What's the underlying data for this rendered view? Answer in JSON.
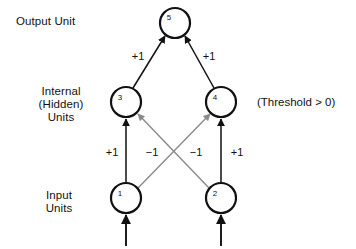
{
  "figure": {
    "type": "neural-network-diagram",
    "background_color": "#ffffff",
    "edge_color_excitatory": "#111111",
    "edge_color_inhibitory": "#8a8a8a"
  },
  "labels": {
    "output_layer": "Output Unit",
    "hidden_layer_line1": "Internal",
    "hidden_layer_line2": "(Hidden)",
    "hidden_layer_line3": "Units",
    "input_layer_line1": "Input",
    "input_layer_line2": "Units",
    "threshold_note": "(Threshold > 0)"
  },
  "nodes": [
    {
      "id": "5",
      "label": "5",
      "layer": "output",
      "cx": 175,
      "cy": 23,
      "r": 15
    },
    {
      "id": "3",
      "label": "3",
      "layer": "hidden",
      "cx": 126,
      "cy": 102,
      "r": 15
    },
    {
      "id": "4",
      "label": "4",
      "layer": "hidden",
      "cx": 221,
      "cy": 102,
      "r": 15
    },
    {
      "id": "1",
      "label": "1",
      "layer": "input",
      "cx": 126,
      "cy": 198,
      "r": 15
    },
    {
      "id": "2",
      "label": "2",
      "layer": "input",
      "cx": 221,
      "cy": 198,
      "r": 15
    }
  ],
  "edges": [
    {
      "id": "e-3-5",
      "from": "3",
      "to": "5",
      "weight": "+1",
      "sign": "excitatory"
    },
    {
      "id": "e-4-5",
      "from": "4",
      "to": "5",
      "weight": "+1",
      "sign": "excitatory"
    },
    {
      "id": "e-1-3",
      "from": "1",
      "to": "3",
      "weight": "+1",
      "sign": "excitatory"
    },
    {
      "id": "e-2-4",
      "from": "2",
      "to": "4",
      "weight": "+1",
      "sign": "excitatory"
    },
    {
      "id": "e-1-4",
      "from": "1",
      "to": "4",
      "weight": "−1",
      "sign": "inhibitory"
    },
    {
      "id": "e-2-3",
      "from": "2",
      "to": "3",
      "weight": "−1",
      "sign": "inhibitory"
    },
    {
      "id": "e-in-1",
      "from": "external",
      "to": "1",
      "weight": "",
      "sign": "excitatory"
    },
    {
      "id": "e-in-2",
      "from": "external",
      "to": "2",
      "weight": "",
      "sign": "excitatory"
    }
  ],
  "weight_labels": {
    "hidden_to_output_left": "+1",
    "hidden_to_output_right": "+1",
    "input1_to_hidden3": "+1",
    "input1_to_hidden4": "−1",
    "input2_to_hidden3": "−1",
    "input2_to_hidden4": "+1"
  }
}
